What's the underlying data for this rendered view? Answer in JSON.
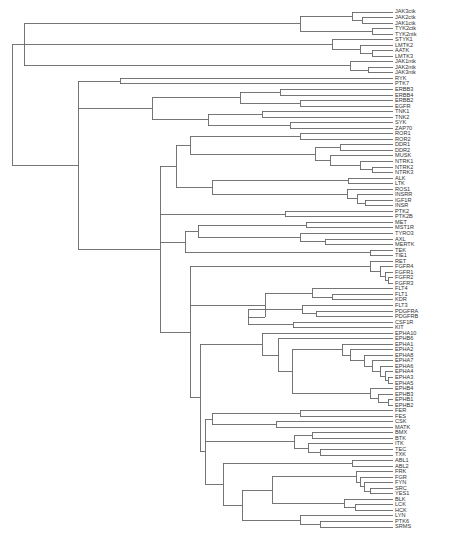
{
  "diagram": {
    "type": "dendrogram",
    "orientation": "left-to-right",
    "line_color": "#666666",
    "label_color": "#333333",
    "leaves": [
      "JAK3ctk",
      "JAK2ctk",
      "JAK1ctk",
      "TYK2ctk",
      "TYK2ntk",
      "STYK1",
      "LMTK2",
      "AATK",
      "LMTK3",
      "JAK1ntk",
      "JAK2ntk",
      "JAK3ntk",
      "RYK",
      "PTK7",
      "ERBB3",
      "ERBB4",
      "ERBB2",
      "EGFR",
      "TNK1",
      "TNK2",
      "SYK",
      "ZAP70",
      "ROR1",
      "ROR2",
      "DDR1",
      "DDR2",
      "MUSK",
      "NTRK1",
      "NTRK2",
      "NTRK3",
      "ALK",
      "LTK",
      "ROS1",
      "INSRR",
      "IGF1R",
      "INSR",
      "PTK2",
      "PTK2B",
      "MET",
      "MST1R",
      "TYRO3",
      "AXL",
      "MERTK",
      "TEK",
      "TIE1",
      "RET",
      "FGFR4",
      "FGFR1",
      "FGFR2",
      "FGFR3",
      "FLT4",
      "FLT1",
      "KDR",
      "FLT3",
      "PDGFRA",
      "PDGFRB",
      "CSF1R",
      "KIT",
      "EPHA10",
      "EPHB6",
      "EPHA1",
      "EPHA2",
      "EPHA8",
      "EPHA7",
      "EPHA6",
      "EPHA4",
      "EPHA3",
      "EPHA5",
      "EPHB4",
      "EPHB3",
      "EPHB1",
      "EPHB2",
      "FER",
      "FES",
      "CSK",
      "MATK",
      "BMX",
      "BTK",
      "ITK",
      "TEC",
      "TXK",
      "ABL1",
      "ABL2",
      "FRK",
      "FGR",
      "FYN",
      "SRC",
      "YES1",
      "BLK",
      "LCK",
      "HCK",
      "LYN",
      "PTK6",
      "SRMS"
    ]
  }
}
